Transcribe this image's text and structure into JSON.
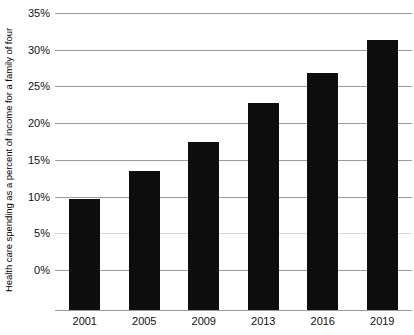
{
  "chart_data": {
    "type": "bar",
    "title": "",
    "subtitle": "",
    "xlabel": "",
    "ylabel": "Health care spending as a percent of income for a family of four",
    "categories": [
      "2001",
      "2005",
      "2009",
      "2013",
      "2016",
      "2019"
    ],
    "values": [
      9.7,
      13.5,
      17.5,
      22.7,
      26.8,
      31.3
    ],
    "series": [
      {
        "name": "Health care spending as a percent of income for a family of four",
        "values": [
          9.7,
          13.5,
          17.5,
          22.7,
          26.8,
          31.3
        ]
      }
    ],
    "ylim": [
      0,
      35
    ],
    "ytick_values": [
      0,
      5,
      10,
      15,
      20,
      25,
      30,
      35
    ],
    "ytick_labels": [
      "0%",
      "5%",
      "10%",
      "15%",
      "20%",
      "25%",
      "30%",
      "35%"
    ],
    "xtick_labels": [
      "2001",
      "2005",
      "2009",
      "2013",
      "2016",
      "2019"
    ],
    "grid": true,
    "grid_axis": "y",
    "legend": false,
    "legend_position": "none",
    "bar_color": "#0d0d0d",
    "gridline_color": "#9b9b9b",
    "background_color": "#ffffff",
    "annotations": []
  }
}
